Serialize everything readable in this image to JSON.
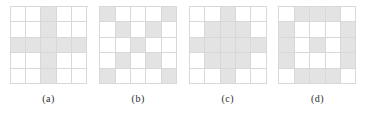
{
  "figure": {
    "grid_size": 5,
    "colors": {
      "filled_cell": "#e3e3e3",
      "empty_cell": "#ffffff",
      "gridline": "#d8d8d8",
      "caption_text": "#2b2b2b",
      "background": "#ffffff"
    },
    "panels": [
      {
        "id": "panel-a",
        "caption": "(a)",
        "pattern_name": "plus-cross",
        "rows": [
          [
            0,
            0,
            1,
            0,
            0
          ],
          [
            0,
            0,
            1,
            0,
            0
          ],
          [
            1,
            1,
            1,
            1,
            1
          ],
          [
            0,
            0,
            1,
            0,
            0
          ],
          [
            0,
            0,
            1,
            0,
            0
          ]
        ]
      },
      {
        "id": "panel-b",
        "caption": "(b)",
        "pattern_name": "diagonal-x",
        "rows": [
          [
            1,
            0,
            0,
            0,
            1
          ],
          [
            0,
            1,
            0,
            1,
            0
          ],
          [
            0,
            0,
            1,
            0,
            0
          ],
          [
            0,
            1,
            0,
            1,
            0
          ],
          [
            1,
            0,
            0,
            0,
            1
          ]
        ]
      },
      {
        "id": "panel-c",
        "caption": "(c)",
        "pattern_name": "diamond",
        "rows": [
          [
            0,
            0,
            1,
            0,
            0
          ],
          [
            0,
            1,
            1,
            1,
            0
          ],
          [
            1,
            1,
            1,
            1,
            1
          ],
          [
            0,
            1,
            1,
            1,
            0
          ],
          [
            0,
            0,
            1,
            0,
            0
          ]
        ]
      },
      {
        "id": "panel-d",
        "caption": "(d)",
        "pattern_name": "ring-with-center",
        "rows": [
          [
            0,
            1,
            1,
            1,
            0
          ],
          [
            1,
            0,
            0,
            0,
            1
          ],
          [
            1,
            0,
            1,
            0,
            1
          ],
          [
            1,
            0,
            0,
            0,
            1
          ],
          [
            0,
            1,
            1,
            1,
            0
          ]
        ]
      }
    ],
    "footnote": ""
  }
}
